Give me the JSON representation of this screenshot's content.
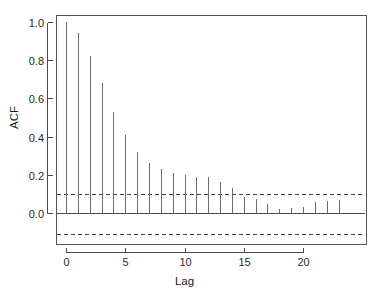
{
  "chart_data": {
    "type": "bar",
    "title": "",
    "subtitle": "",
    "xlabel": "Lag",
    "ylabel": "ACF",
    "xlim": [
      -1,
      24.5
    ],
    "ylim": [
      -0.16,
      1.06
    ],
    "grid": false,
    "legend": null,
    "x": [
      0,
      1,
      2,
      3,
      4,
      5,
      6,
      7,
      8,
      9,
      10,
      11,
      12,
      13,
      14,
      15,
      16,
      17,
      18,
      19,
      20,
      21,
      22,
      23
    ],
    "categories": [
      "0",
      "1",
      "2",
      "3",
      "4",
      "5",
      "6",
      "7",
      "8",
      "9",
      "10",
      "11",
      "12",
      "13",
      "14",
      "15",
      "16",
      "17",
      "18",
      "19",
      "20",
      "21",
      "22",
      "23"
    ],
    "values": [
      1.0,
      0.94,
      0.82,
      0.68,
      0.53,
      0.41,
      0.32,
      0.26,
      0.23,
      0.21,
      0.2,
      0.19,
      0.19,
      0.16,
      0.13,
      0.085,
      0.072,
      0.045,
      0.02,
      0.026,
      0.033,
      0.057,
      0.065,
      0.068
    ],
    "series": [
      {
        "name": "ACF",
        "values": [
          1.0,
          0.94,
          0.82,
          0.68,
          0.53,
          0.41,
          0.32,
          0.26,
          0.23,
          0.21,
          0.2,
          0.19,
          0.19,
          0.16,
          0.13,
          0.085,
          0.072,
          0.045,
          0.02,
          0.026,
          0.033,
          0.057,
          0.065,
          0.068
        ]
      }
    ],
    "confidence_bounds": {
      "upper": 0.1,
      "lower": -0.11,
      "style": "dashed"
    },
    "zero_line": 0.0,
    "x_ticks": [
      0,
      5,
      10,
      15,
      20
    ],
    "x_tick_labels": [
      "0",
      "5",
      "10",
      "15",
      "20"
    ],
    "y_ticks": [
      0.0,
      0.2,
      0.4,
      0.6,
      0.8,
      1.0
    ],
    "y_tick_labels": [
      "0.0",
      "0.2",
      "0.4",
      "0.6",
      "0.8",
      "1.0"
    ],
    "colors": {
      "stem": "#6b6b6b",
      "axis": "#4a4a4a",
      "frame": "#555555",
      "confidence": "#3d3d3d",
      "background": "#ffffff",
      "text": "#1a1a1a"
    }
  },
  "labels": {
    "y_axis_title": "ACF",
    "x_axis_title": "Lag"
  }
}
